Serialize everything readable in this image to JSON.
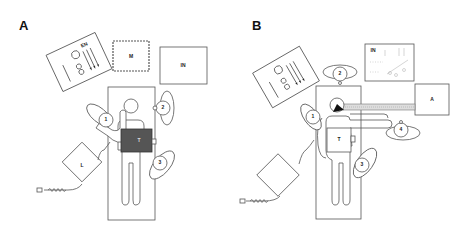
{
  "figure": {
    "panels": [
      {
        "id": "A",
        "label": "A",
        "elements": {
          "equipment_table": "EN",
          "monitor": "M",
          "instrument_table": "IN",
          "laser_device": "L",
          "patient_target": "T",
          "staff": [
            "1",
            "2",
            "3"
          ]
        }
      },
      {
        "id": "B",
        "label": "B",
        "elements": {
          "equipment_table": "",
          "instrument_table": "IN",
          "anesthesia_device": "A",
          "patient_target": "T",
          "staff": [
            "1",
            "2",
            "3",
            "4"
          ]
        }
      }
    ],
    "colors": {
      "line": "#555555",
      "target_fill_A": "#555555",
      "background": "#ffffff"
    }
  }
}
